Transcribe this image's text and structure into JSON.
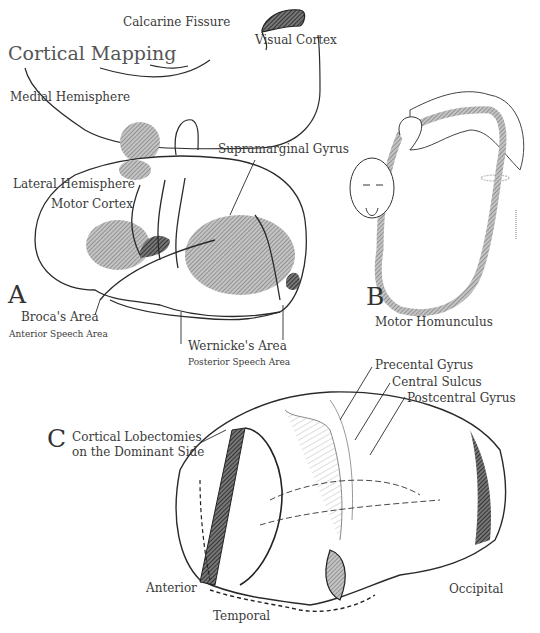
{
  "figure": {
    "title": "Cortical Mapping",
    "panels": {
      "A": {
        "letter": "A",
        "labels": {
          "calcarine_fissure": "Calcarine Fissure",
          "visual_cortex": "Visual Cortex",
          "medial_hemisphere": "Medial Hemisphere",
          "lateral_hemisphere": "Lateral Hemisphere",
          "motor_cortex": "Motor Cortex",
          "supramarginal_gyrus": "Supramarginal Gyrus",
          "brocas_area": "Broca's Area",
          "anterior_speech_area": "Anterior Speech Area",
          "wernickes_area": "Wernicke's Area",
          "posterior_speech_area": "Posterior Speech Area"
        }
      },
      "B": {
        "letter": "B",
        "caption": "Motor Homunculus"
      },
      "C": {
        "letter": "C",
        "caption_line1": "Cortical Lobectomies",
        "caption_line2": "on the Dominant Side",
        "labels": {
          "precentral_gyrus": "Precental Gyrus",
          "central_sulcus": "Central Sulcus",
          "postcentral_gyrus": "Postcentral Gyrus",
          "anterior": "Anterior",
          "temporal": "Temporal",
          "occipital": "Occipital"
        }
      }
    },
    "colors": {
      "ink": "#2a2a2a",
      "shade_light": "#9a9a9a",
      "shade_dark": "#444444"
    }
  }
}
